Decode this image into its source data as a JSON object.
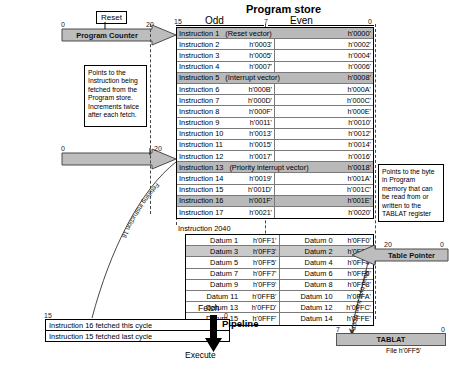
{
  "diagram": {
    "title": "Program store",
    "columns": {
      "odd": "Odd",
      "even": "Even"
    },
    "bits": {
      "b15": "15",
      "b7": "7",
      "b0": "0",
      "b20": "20",
      "b0b": "0"
    }
  },
  "program_counter": {
    "label": "Program Counter",
    "reset_label": "Reset",
    "msb": "0",
    "lsb": "20",
    "note": "Points to the Instruction being fetched from the Program store. Increments twice after each fetch."
  },
  "table_pointer": {
    "label": "Table Pointer",
    "msb": "20",
    "lsb": "0",
    "note": "Points to the byte in Program memory that can be read from or written to the TABLAT register",
    "read_label": "Read byte from h'0FF2'"
  },
  "tablat": {
    "label": "TABLAT",
    "file": "File h'0FF5'",
    "msb": "7",
    "lsb": "0"
  },
  "fetch_label": "Fetching instruction 16",
  "pipeline": {
    "label": "Pipeline",
    "fetch": "Fetch",
    "execute": "Execute",
    "msb": "15",
    "lsb": "0",
    "rows": [
      "Instruction 16 fetched this cycle",
      "Instruction 15 fetched last cycle"
    ]
  },
  "instruction_table": [
    {
      "odd": "Instruction 1",
      "odd_addr": "",
      "vector": "(Reset vector)",
      "even": "",
      "even_addr": "h'0000'",
      "shade": true,
      "full": true
    },
    {
      "odd": "Instruction 2",
      "odd_addr": "h'0003'",
      "even": "",
      "even_addr": "h'0002'",
      "shade": false
    },
    {
      "odd": "Instruction 3",
      "odd_addr": "h'0005'",
      "even": "",
      "even_addr": "h'0004'",
      "shade": false
    },
    {
      "odd": "Instruction 4",
      "odd_addr": "h'0007'",
      "even": "",
      "even_addr": "h'0006'",
      "shade": false
    },
    {
      "odd": "Instruction 5",
      "odd_addr": "",
      "vector": "(Interrupt vector)",
      "even": "",
      "even_addr": "h'0008'",
      "shade": true,
      "full": true
    },
    {
      "odd": "Instruction 6",
      "odd_addr": "h'000B'",
      "even": "",
      "even_addr": "h'000A'",
      "shade": false
    },
    {
      "odd": "Instruction 7",
      "odd_addr": "h'000D'",
      "even": "",
      "even_addr": "h'000C'",
      "shade": false
    },
    {
      "odd": "Instruction 8",
      "odd_addr": "h'000F'",
      "even": "",
      "even_addr": "h'000E'",
      "shade": false
    },
    {
      "odd": "Instruction 9",
      "odd_addr": "h'0011'",
      "even": "",
      "even_addr": "h'0010'",
      "shade": false
    },
    {
      "odd": "Instruction 10",
      "odd_addr": "h'0013'",
      "even": "",
      "even_addr": "h'0012'",
      "shade": false
    },
    {
      "odd": "Instruction 11",
      "odd_addr": "h'0015'",
      "even": "",
      "even_addr": "h'0014'",
      "shade": false
    },
    {
      "odd": "Instruction 12",
      "odd_addr": "h'0017'",
      "even": "",
      "even_addr": "h'0016'",
      "shade": false
    },
    {
      "odd": "Instruction 13",
      "odd_addr": "",
      "vector": "(Priority interrupt vector)",
      "even": "",
      "even_addr": "h'0018'",
      "shade": true,
      "full": true
    },
    {
      "odd": "Instruction 14",
      "odd_addr": "h'0019'",
      "even": "",
      "even_addr": "h'001A'",
      "shade": false
    },
    {
      "odd": "Instruction 15",
      "odd_addr": "h'001D'",
      "even": "",
      "even_addr": "h'001C'",
      "shade": false
    },
    {
      "odd": "Instruction 16",
      "odd_addr": "h'001F'",
      "even": "",
      "even_addr": "h'001E'",
      "shade": true
    },
    {
      "odd": "Instruction 17",
      "odd_addr": "h'0021'",
      "even": "",
      "even_addr": "h'0020'",
      "shade": false
    }
  ],
  "last_instruction": "Instruction 2040",
  "datum_table": [
    {
      "odd": "Datum 1",
      "odd_addr": "h'0FF1'",
      "even": "Datum 0",
      "even_addr": "h'0FF0'",
      "shade": false
    },
    {
      "odd": "Datum 3",
      "odd_addr": "h'0FF3'",
      "even": "Datum 2",
      "even_addr": "h'0FF2'",
      "shade": true
    },
    {
      "odd": "Datum 5",
      "odd_addr": "h'0FF5'",
      "even": "Datum 4",
      "even_addr": "h'0FF4'",
      "shade": false
    },
    {
      "odd": "Datum 7",
      "odd_addr": "h'0FF7'",
      "even": "Datum 6",
      "even_addr": "h'0FF6'",
      "shade": false
    },
    {
      "odd": "Datum 9",
      "odd_addr": "h'0FF9'",
      "even": "Datum 8",
      "even_addr": "h'0FF8'",
      "shade": false
    },
    {
      "odd": "Datum 11",
      "odd_addr": "h'0FFB'",
      "even": "Datum 10",
      "even_addr": "h'0FFA'",
      "shade": false
    },
    {
      "odd": "Datum 13",
      "odd_addr": "h'0FFD'",
      "even": "Datum 12",
      "even_addr": "h'0FFC'",
      "shade": false
    },
    {
      "odd": "Datum 15",
      "odd_addr": "h'0FFF'",
      "even": "Datum 14",
      "even_addr": "h'0FFE'",
      "shade": false
    }
  ]
}
